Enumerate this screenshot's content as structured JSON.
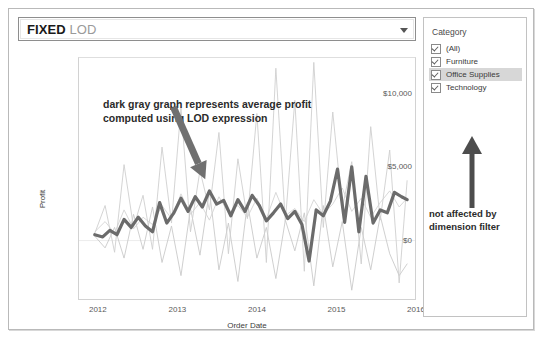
{
  "parameter_control": {
    "keyword": "FIXED",
    "rest": "LOD",
    "dropdown_icon": "chevron-down-icon"
  },
  "chart_annotation": "dark gray graph represents average profit computed using LOD expression",
  "filter": {
    "title": "Category",
    "items": [
      {
        "label": "(All)",
        "checked": true,
        "selected": false
      },
      {
        "label": "Furniture",
        "checked": true,
        "selected": false
      },
      {
        "label": "Office Supplies",
        "checked": true,
        "selected": true
      },
      {
        "label": "Technology",
        "checked": true,
        "selected": false
      }
    ],
    "callout": "not affected by dimension filter",
    "callout_icon": "up-arrow-icon"
  },
  "colors": {
    "lod_line": "#6b6b6b",
    "category_line": "#c8c8c8",
    "annotation_arrow": "#707070",
    "selected_row": "#d7d7d7",
    "frame": "#b9b9b9"
  },
  "chart_data": {
    "type": "line",
    "title": "",
    "xlabel": "Order Date",
    "ylabel": "Profit",
    "xlim": [
      2011.75,
      2016.0
    ],
    "ylim": [
      -4000,
      12500
    ],
    "yticks": [
      0,
      5000,
      10000
    ],
    "ytick_labels": [
      "$0",
      "$5,000",
      "$10,000"
    ],
    "xticks": [
      2012,
      2013,
      2014,
      2015,
      2016
    ],
    "xtick_labels": [
      "2012",
      "2013",
      "2014",
      "2015",
      "2016"
    ],
    "grid": false,
    "zero_line": true,
    "legend": "none",
    "annotations": [
      {
        "text": "dark gray graph represents average profit computed using LOD expression",
        "arrow_from": [
          2012.95,
          9100
        ],
        "arrow_to": [
          2013.35,
          4200
        ]
      }
    ],
    "series": [
      {
        "name": "LOD average profit (FIXED)",
        "color": "#6b6b6b",
        "width": 3.2,
        "x": [
          2011.95,
          2012.05,
          2012.14,
          2012.23,
          2012.32,
          2012.41,
          2012.5,
          2012.59,
          2012.68,
          2012.77,
          2012.86,
          2012.95,
          2013.04,
          2013.13,
          2013.22,
          2013.31,
          2013.4,
          2013.49,
          2013.58,
          2013.67,
          2013.76,
          2013.85,
          2013.94,
          2014.03,
          2014.12,
          2014.21,
          2014.3,
          2014.39,
          2014.48,
          2014.57,
          2014.66,
          2014.75,
          2014.84,
          2014.93,
          2015.02,
          2015.11,
          2015.2,
          2015.29,
          2015.38,
          2015.47,
          2015.56,
          2015.65,
          2015.74,
          2015.83,
          2015.9
        ],
        "y": [
          400,
          250,
          700,
          400,
          1450,
          900,
          1600,
          1000,
          600,
          2600,
          1200,
          1900,
          2900,
          2000,
          3000,
          2300,
          3400,
          2500,
          2750,
          1700,
          2800,
          2000,
          3100,
          2400,
          1350,
          1900,
          2500,
          1500,
          2000,
          1100,
          -1400,
          2100,
          1700,
          2700,
          4900,
          1250,
          5050,
          600,
          4400,
          1200,
          2100,
          1900,
          3300,
          3000,
          2800
        ]
      },
      {
        "name": "Furniture",
        "color": "#c9c9c9",
        "width": 0.9,
        "x": [
          2011.95,
          2012.08,
          2012.2,
          2012.32,
          2012.44,
          2012.56,
          2012.68,
          2012.8,
          2012.92,
          2013.04,
          2013.16,
          2013.28,
          2013.4,
          2013.52,
          2013.64,
          2013.76,
          2013.88,
          2014.0,
          2014.12,
          2014.24,
          2014.36,
          2014.48,
          2014.6,
          2014.72,
          2014.84,
          2014.96,
          2015.08,
          2015.2,
          2015.32,
          2015.44,
          2015.56,
          2015.68,
          2015.8,
          2015.9
        ],
        "y": [
          300,
          -500,
          900,
          -1200,
          1800,
          -600,
          2300,
          -1500,
          1000,
          -2400,
          2200,
          -1000,
          3400,
          -2000,
          1200,
          -2800,
          2600,
          -1200,
          900,
          -2600,
          1400,
          -700,
          1900,
          -3100,
          2400,
          -1800,
          1300,
          -3400,
          900,
          -2000,
          1700,
          -900,
          -2400,
          -1600
        ]
      },
      {
        "name": "Office Supplies",
        "color": "#d4d4d4",
        "width": 0.9,
        "x": [
          2011.95,
          2012.08,
          2012.2,
          2012.32,
          2012.44,
          2012.56,
          2012.68,
          2012.8,
          2012.92,
          2013.04,
          2013.16,
          2013.28,
          2013.4,
          2013.52,
          2013.64,
          2013.76,
          2013.88,
          2014.0,
          2014.12,
          2014.24,
          2014.36,
          2014.48,
          2014.6,
          2014.72,
          2014.84,
          2014.96,
          2015.08,
          2015.2,
          2015.32,
          2015.44,
          2015.56,
          2015.68,
          2015.8,
          2015.9
        ],
        "y": [
          600,
          1300,
          500,
          2100,
          800,
          1600,
          1100,
          2400,
          1500,
          3200,
          1800,
          2600,
          1400,
          3000,
          1900,
          2400,
          1600,
          2900,
          1500,
          3300,
          1700,
          2200,
          1300,
          2800,
          1800,
          2500,
          3600,
          2000,
          2900,
          1600,
          2600,
          3400,
          2300,
          2900
        ]
      },
      {
        "name": "Technology",
        "color": "#cfcfcf",
        "width": 0.9,
        "x": [
          2011.95,
          2012.08,
          2012.2,
          2012.32,
          2012.44,
          2012.56,
          2012.68,
          2012.8,
          2012.92,
          2013.04,
          2013.16,
          2013.28,
          2013.4,
          2013.52,
          2013.64,
          2013.76,
          2013.88,
          2014.0,
          2014.12,
          2014.24,
          2014.36,
          2014.48,
          2014.6,
          2014.72,
          2014.84,
          2014.96,
          2015.08,
          2015.2,
          2015.32,
          2015.44,
          2015.56,
          2015.68,
          2015.8,
          2015.9
        ],
        "y": [
          500,
          2400,
          -800,
          5200,
          900,
          3100,
          -600,
          6400,
          1200,
          9100,
          600,
          4800,
          2100,
          7400,
          -900,
          5600,
          1500,
          8700,
          -1500,
          11800,
          1300,
          9600,
          -2100,
          12200,
          900,
          8800,
          2200,
          5400,
          -1600,
          7800,
          1400,
          6200,
          -2900,
          4100
        ]
      }
    ]
  }
}
